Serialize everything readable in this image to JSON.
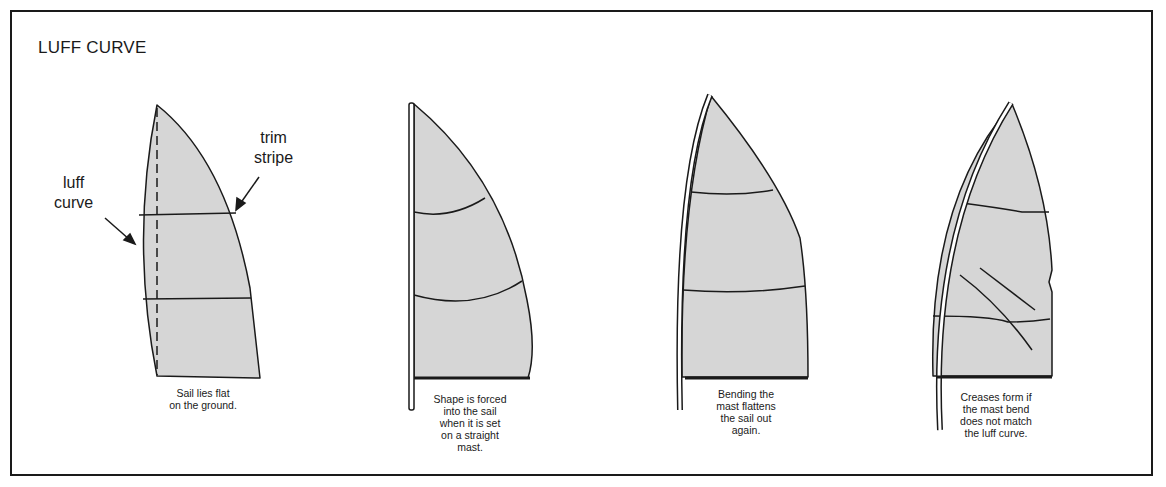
{
  "title": "LUFF CURVE",
  "colors": {
    "sail_fill": "#d6d6d6",
    "line": "#1a1a1a",
    "background": "#ffffff"
  },
  "panels": [
    {
      "id": "flat",
      "labels": {
        "luff_curve": [
          "luff",
          "curve"
        ],
        "trim_stripe": [
          "trim",
          "stripe"
        ]
      },
      "caption": [
        "Sail lies flat",
        "on the ground."
      ]
    },
    {
      "id": "straight-mast",
      "caption": [
        "Shape is forced",
        "into the sail",
        "when it is set",
        "on a straight",
        "mast."
      ]
    },
    {
      "id": "bent-mast",
      "caption": [
        "Bending the",
        "mast flattens",
        "the sail out",
        "again."
      ]
    },
    {
      "id": "mismatched-bend",
      "caption": [
        "Creases form if",
        "the mast bend",
        "does not match",
        "the luff curve."
      ]
    }
  ]
}
